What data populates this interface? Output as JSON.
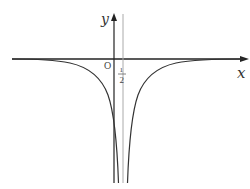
{
  "figure": {
    "type": "function-graph",
    "axes": {
      "x_label": "x",
      "y_label": "y",
      "origin_label": "O"
    },
    "asymptote": {
      "label_numerator": "1",
      "label_denominator": "2",
      "value": 0.5
    },
    "colors": {
      "axis": "#222222",
      "curve": "#333333",
      "asymptote": "#999999"
    }
  }
}
